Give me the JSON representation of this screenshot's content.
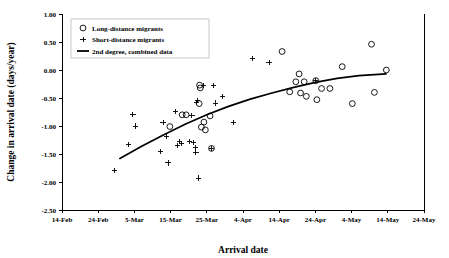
{
  "chart_data": {
    "type": "scatter",
    "title": "",
    "xlabel": "Arrival date",
    "ylabel": "Change in arrival date (days/year)",
    "xtick_labels": [
      "14-Feb",
      "24-Feb",
      "5-Mar",
      "15-Mar",
      "25-Mar",
      "4-Apr",
      "14-Apr",
      "24-Apr",
      "4-May",
      "14-May",
      "24-May"
    ],
    "xtick_values": [
      0,
      10,
      20,
      30,
      40,
      50,
      60,
      70,
      80,
      90,
      100
    ],
    "xlim": [
      0,
      100
    ],
    "ytick_labels": [
      "1.00",
      "0.50",
      "0.00",
      "-0.50",
      "-1.00",
      "-1.50",
      "-2.00",
      "-2.50"
    ],
    "ytick_values": [
      1.0,
      0.5,
      0.0,
      -0.5,
      -1.0,
      -1.5,
      -2.0,
      -2.5
    ],
    "ylim": [
      -2.5,
      1.0
    ],
    "grid": false,
    "legend_position": "top-left",
    "legend": [
      {
        "key": "long-distance",
        "marker": "circle",
        "label": "Long-distance migrants"
      },
      {
        "key": "short-distance",
        "marker": "plus",
        "label": "Short-distance migrants"
      },
      {
        "key": "fit",
        "marker": "line",
        "label": "2nd degree, combined data"
      }
    ],
    "series": [
      {
        "name": "Long-distance migrants",
        "marker": "circle",
        "points": [
          [
            29.8,
            -1.01
          ],
          [
            33.2,
            -0.8
          ],
          [
            34.3,
            -0.8
          ],
          [
            37.9,
            -0.6
          ],
          [
            38.0,
            -0.27
          ],
          [
            38.2,
            -0.32
          ],
          [
            38.5,
            -1.02
          ],
          [
            39.2,
            -0.93
          ],
          [
            39.6,
            -1.07
          ],
          [
            40.9,
            -0.82
          ],
          [
            41.3,
            -1.4
          ],
          [
            60.8,
            0.33
          ],
          [
            62.9,
            -0.39
          ],
          [
            64.6,
            -0.21
          ],
          [
            65.5,
            -0.07
          ],
          [
            65.9,
            -0.41
          ],
          [
            66.9,
            -0.21
          ],
          [
            67.5,
            -0.47
          ],
          [
            70.1,
            -0.19
          ],
          [
            70.4,
            -0.53
          ],
          [
            71.7,
            -0.33
          ],
          [
            74.0,
            -0.33
          ],
          [
            77.4,
            0.06
          ],
          [
            80.2,
            -0.6
          ],
          [
            85.5,
            0.46
          ],
          [
            86.3,
            -0.4
          ],
          [
            89.6,
            0.0
          ]
        ]
      },
      {
        "name": "Short-distance migrants",
        "marker": "plus",
        "points": [
          [
            14.4,
            -1.8
          ],
          [
            18.3,
            -1.33
          ],
          [
            19.6,
            -0.8
          ],
          [
            20.2,
            -1.0
          ],
          [
            27.3,
            -1.46
          ],
          [
            27.9,
            -0.94
          ],
          [
            28.8,
            -1.19
          ],
          [
            29.3,
            -1.66
          ],
          [
            31.4,
            -0.74
          ],
          [
            32.0,
            -1.35
          ],
          [
            32.4,
            -1.27
          ],
          [
            33.0,
            -1.31
          ],
          [
            35.2,
            -1.27
          ],
          [
            35.9,
            -0.81
          ],
          [
            36.3,
            -1.3
          ],
          [
            36.9,
            -1.38
          ],
          [
            37.0,
            -1.47
          ],
          [
            37.1,
            -0.58
          ],
          [
            37.4,
            -0.54
          ],
          [
            37.6,
            -1.93
          ],
          [
            39.0,
            -0.28
          ],
          [
            41.2,
            -1.4
          ],
          [
            41.9,
            -0.27
          ],
          [
            42.4,
            -0.59
          ],
          [
            44.3,
            -0.47
          ],
          [
            47.3,
            -0.94
          ],
          [
            52.7,
            0.21
          ],
          [
            57.2,
            0.14
          ],
          [
            70.1,
            -0.19
          ]
        ]
      }
    ],
    "fit_curve": {
      "name": "2nd degree, combined data",
      "description": "2nd degree polynomial fit over combined data",
      "x_start": 16.0,
      "x_end": 89.5,
      "points": [
        [
          16.0,
          -1.58
        ],
        [
          22.0,
          -1.36
        ],
        [
          28.0,
          -1.16
        ],
        [
          34.0,
          -0.97
        ],
        [
          40.0,
          -0.8
        ],
        [
          46.0,
          -0.65
        ],
        [
          52.0,
          -0.52
        ],
        [
          58.0,
          -0.41
        ],
        [
          64.0,
          -0.31
        ],
        [
          70.0,
          -0.22
        ],
        [
          76.0,
          -0.15
        ],
        [
          82.0,
          -0.1
        ],
        [
          89.5,
          -0.07
        ]
      ]
    }
  }
}
